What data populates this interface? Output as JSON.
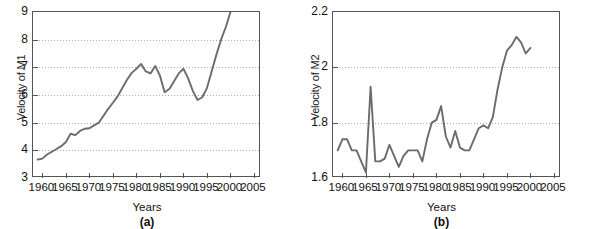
{
  "figure": {
    "background": "#ffffff",
    "line_color": "#6b6b6b",
    "frame_color": "#555555",
    "grid_color": "#aaaaaa"
  },
  "chart_data": [
    {
      "type": "line",
      "panel_label": "(a)",
      "title": "",
      "xlabel": "Years",
      "ylabel": "Velocity of M1",
      "xlim": [
        1958,
        2006.5
      ],
      "ylim": [
        3,
        9
      ],
      "xticks": [
        1960,
        1965,
        1970,
        1975,
        1980,
        1985,
        1990,
        1995,
        2000,
        2005
      ],
      "xticklabels": [
        "1960",
        "1965",
        "1970",
        "1975",
        "1980",
        "1985",
        "1990",
        "1995",
        "2000",
        "2005"
      ],
      "yticks": [
        3,
        4,
        5,
        6,
        7,
        8,
        9
      ],
      "yticklabels": [
        "3",
        "4",
        "5",
        "6",
        "7",
        "8",
        "9"
      ],
      "grid": "horizontal-dotted",
      "legend": "none",
      "series": [
        {
          "name": "Velocity of M1",
          "x": [
            1959,
            1960,
            1961,
            1962,
            1963,
            1964,
            1965,
            1966,
            1967,
            1968,
            1969,
            1970,
            1971,
            1972,
            1973,
            1974,
            1975,
            1976,
            1977,
            1978,
            1979,
            1980,
            1981,
            1982,
            1983,
            1984,
            1985,
            1986,
            1987,
            1988,
            1989,
            1990,
            1991,
            1992,
            1993,
            1994,
            1995,
            1996,
            1997,
            1998,
            1999,
            2000
          ],
          "values": [
            3.67,
            3.7,
            3.85,
            3.95,
            4.05,
            4.15,
            4.3,
            4.6,
            4.55,
            4.7,
            4.78,
            4.8,
            4.9,
            5.0,
            5.25,
            5.5,
            5.72,
            5.95,
            6.25,
            6.55,
            6.8,
            6.95,
            7.12,
            6.85,
            6.78,
            7.05,
            6.7,
            6.1,
            6.22,
            6.5,
            6.78,
            6.95,
            6.6,
            6.15,
            5.82,
            5.92,
            6.25,
            6.85,
            7.45,
            8.0,
            8.45,
            9.0
          ]
        }
      ]
    },
    {
      "type": "line",
      "panel_label": "(b)",
      "title": "",
      "xlabel": "Years",
      "ylabel": "Velocity of M2",
      "xlim": [
        1958,
        2006.5
      ],
      "ylim": [
        1.6,
        2.2
      ],
      "xticks": [
        1960,
        1965,
        1970,
        1975,
        1980,
        1985,
        1990,
        1995,
        2000,
        2005
      ],
      "xticklabels": [
        "1960",
        "1965",
        "1970",
        "1975",
        "1980",
        "1985",
        "1990",
        "1995",
        "2000",
        "2005"
      ],
      "yticks": [
        1.6,
        1.8,
        2.0,
        2.2
      ],
      "yticklabels": [
        "1.6",
        "1.8",
        "2",
        "2.2"
      ],
      "grid": "horizontal-dotted",
      "legend": "none",
      "series": [
        {
          "name": "Velocity of M2",
          "x": [
            1959,
            1960,
            1961,
            1962,
            1963,
            1964,
            1965,
            1966,
            1967,
            1968,
            1969,
            1970,
            1971,
            1972,
            1973,
            1974,
            1975,
            1976,
            1977,
            1978,
            1979,
            1980,
            1981,
            1982,
            1983,
            1984,
            1985,
            1986,
            1987,
            1988,
            1989,
            1990,
            1991,
            1992,
            1993,
            1994,
            1995,
            1996,
            1997,
            1998,
            1999,
            2000
          ],
          "values": [
            1.7,
            1.74,
            1.74,
            1.7,
            1.7,
            1.66,
            1.62,
            1.93,
            1.66,
            1.66,
            1.67,
            1.72,
            1.68,
            1.64,
            1.68,
            1.7,
            1.7,
            1.7,
            1.66,
            1.74,
            1.8,
            1.81,
            1.86,
            1.75,
            1.71,
            1.77,
            1.71,
            1.7,
            1.7,
            1.74,
            1.78,
            1.79,
            1.78,
            1.82,
            1.92,
            2.0,
            2.06,
            2.08,
            2.11,
            2.09,
            2.05,
            2.07
          ]
        }
      ]
    }
  ]
}
